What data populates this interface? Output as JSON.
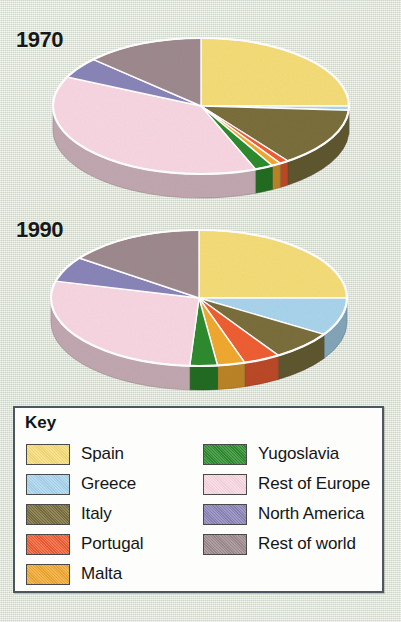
{
  "figure": {
    "background_color": "#dfe5d8",
    "key_title": "Key"
  },
  "charts": [
    {
      "year_label": "1970"
    },
    {
      "year_label": "1990"
    }
  ],
  "legend": {
    "left_column": [
      {
        "label": "Spain",
        "color": "#f5dc78"
      },
      {
        "label": "Greece",
        "color": "#a8d4ec"
      },
      {
        "label": "Italy",
        "color": "#7a6e3c"
      },
      {
        "label": "Portugal",
        "color": "#ee5e33"
      },
      {
        "label": "Malta",
        "color": "#f0a830"
      }
    ],
    "right_column": [
      {
        "label": "Yugoslavia",
        "color": "#2e8b2e"
      },
      {
        "label": "Rest of Europe",
        "color": "#f7d6e2"
      },
      {
        "label": "North America",
        "color": "#8a85b8"
      },
      {
        "label": "Rest of world",
        "color": "#9e8a8e"
      }
    ]
  },
  "chart_data": {
    "type": "pie",
    "legend_position": "bottom",
    "categories": [
      "Spain",
      "Greece",
      "Italy",
      "Portugal",
      "Malta",
      "Yugoslavia",
      "Rest of Europe",
      "North America",
      "Rest of world"
    ],
    "colors": [
      "#f5dc78",
      "#a8d4ec",
      "#7a6e3c",
      "#ee5e33",
      "#f0a830",
      "#2e8b2e",
      "#f7d6e2",
      "#8a85b8",
      "#9e8a8e"
    ],
    "series": [
      {
        "name": "1970",
        "values": [
          25,
          1,
          14,
          1,
          1,
          2,
          38,
          5,
          13
        ],
        "unit": "percent"
      },
      {
        "name": "1990",
        "values": [
          25,
          9,
          7,
          4,
          3,
          3,
          28,
          6,
          15
        ],
        "unit": "percent"
      }
    ]
  }
}
